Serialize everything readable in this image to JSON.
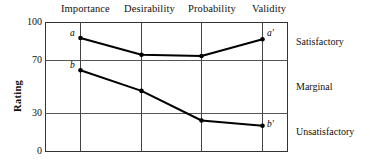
{
  "chart_data": {
    "type": "line",
    "title": "",
    "xlabel": "",
    "ylabel": "Rating",
    "categories": [
      "Importance",
      "Desirability",
      "Probability",
      "Validity"
    ],
    "ylim": [
      0,
      100
    ],
    "yticks": [
      0,
      30,
      70,
      100
    ],
    "grid": true,
    "legend": "none",
    "series": [
      {
        "name": "a",
        "start_label": "a",
        "end_label": "a'",
        "values": [
          88,
          75,
          74,
          87
        ]
      },
      {
        "name": "b",
        "start_label": "b",
        "end_label": "b'",
        "values": [
          63,
          47,
          24,
          20
        ]
      }
    ],
    "zone_bands": [
      {
        "label": "Satisfactory",
        "range": [
          70,
          100
        ]
      },
      {
        "label": "Marginal",
        "range": [
          30,
          70
        ]
      },
      {
        "label": "Unsatisfactory",
        "range": [
          0,
          30
        ]
      }
    ]
  },
  "axis": {
    "y_label": "Rating",
    "y_tick_100": "100",
    "y_tick_70": "70",
    "y_tick_30": "30",
    "y_tick_0": "0"
  },
  "columns": {
    "c0": "Importance",
    "c1": "Desirability",
    "c2": "Probability",
    "c3": "Validity"
  },
  "zones": {
    "satisfactory": "Satisfactory",
    "marginal": "Marginal",
    "unsatisfactory": "Unsatisfactory"
  },
  "points": {
    "a": "a",
    "a_prime": "a′",
    "b": "b",
    "b_prime": "b′"
  },
  "colors": {
    "line": "#000000",
    "grid": "#555555",
    "frame": "#333333",
    "background": "#ffffff"
  }
}
